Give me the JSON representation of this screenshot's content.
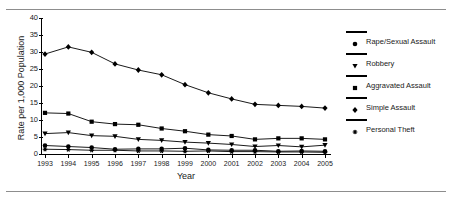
{
  "figure": {
    "title_fragment": "",
    "ylabel": "Rate per 1,000 Population",
    "xlabel": "Year"
  },
  "axis": {
    "y_ticks": [
      "0",
      "5",
      "10",
      "15",
      "20",
      "25",
      "30",
      "35",
      "40"
    ],
    "x_ticks": [
      "1993",
      "1994",
      "1995",
      "1996",
      "1997",
      "1998",
      "1999",
      "2000",
      "2001",
      "2002",
      "2003",
      "2004",
      "2005"
    ]
  },
  "legend": {
    "items": [
      {
        "label": "Rape/Sexual Assault",
        "marker": "circle-marker"
      },
      {
        "label": "Robbery",
        "marker": "triangle-down-marker"
      },
      {
        "label": "Aggravated Assault",
        "marker": "square-marker"
      },
      {
        "label": "Simple Assault",
        "marker": "diamond-marker"
      },
      {
        "label": "Personal Theft",
        "marker": "asterisk-marker"
      }
    ]
  },
  "chart_data": {
    "type": "line",
    "title": "",
    "xlabel": "Year",
    "ylabel": "Rate per 1,000 Population",
    "x": [
      1993,
      1994,
      1995,
      1996,
      1997,
      1998,
      1999,
      2000,
      2001,
      2002,
      2003,
      2004,
      2005
    ],
    "ylim": [
      0,
      40
    ],
    "ytick_step": 5,
    "grid": false,
    "legend_position": "right",
    "color": "#000000",
    "series": [
      {
        "name": "Simple Assault",
        "marker": "diamond",
        "values": [
          29.4,
          31.5,
          29.9,
          26.5,
          24.7,
          23.3,
          20.4,
          18.0,
          16.2,
          14.6,
          14.3,
          14.0,
          13.5
        ]
      },
      {
        "name": "Aggravated Assault",
        "marker": "square",
        "values": [
          12.1,
          11.9,
          9.5,
          8.8,
          8.6,
          7.5,
          6.7,
          5.7,
          5.3,
          4.3,
          4.6,
          4.6,
          4.3
        ]
      },
      {
        "name": "Robbery",
        "marker": "triangle-down",
        "values": [
          6.0,
          6.3,
          5.4,
          5.2,
          4.3,
          4.0,
          3.5,
          3.2,
          2.8,
          2.2,
          2.5,
          2.1,
          2.6
        ]
      },
      {
        "name": "Rape/Sexual Assault",
        "marker": "circle",
        "values": [
          2.5,
          2.2,
          1.9,
          1.4,
          1.5,
          1.5,
          1.7,
          1.2,
          1.1,
          1.1,
          0.8,
          0.9,
          0.8
        ]
      },
      {
        "name": "Personal Theft",
        "marker": "asterisk",
        "values": [
          1.4,
          1.3,
          1.1,
          1.1,
          0.9,
          0.9,
          0.8,
          0.9,
          0.7,
          0.7,
          0.6,
          0.6,
          0.5
        ]
      }
    ]
  }
}
